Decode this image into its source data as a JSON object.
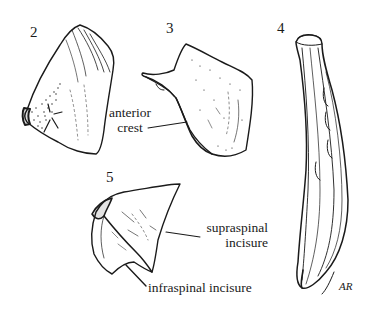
{
  "figure": {
    "panels": [
      {
        "number": "2",
        "subject": "bone-fragment-stippled"
      },
      {
        "number": "3",
        "subject": "bone-with-anterior-crest"
      },
      {
        "number": "4",
        "subject": "elongated-curved-bone"
      },
      {
        "number": "5",
        "subject": "triangular-bone-with-incisures"
      }
    ],
    "labels": {
      "anterior_crest_line1": "anterior",
      "anterior_crest_line2": "crest",
      "supraspinal_line1": "supraspinal",
      "supraspinal_line2": "incisure",
      "infraspinal": "infraspinal incisure"
    },
    "signature": "AR",
    "colors": {
      "ink": "#1a1a1a",
      "paper": "#ffffff"
    }
  }
}
